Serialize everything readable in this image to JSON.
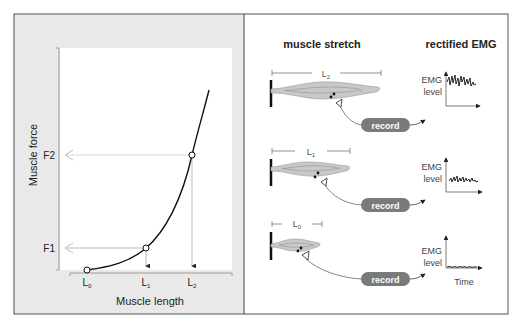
{
  "left_panel": {
    "y_axis_label": "Muscle force",
    "x_axis_label": "Muscle length",
    "y_ticks": [
      {
        "label": "F2",
        "y": 155
      },
      {
        "label": "F1",
        "y": 248
      }
    ],
    "x_ticks": [
      {
        "label": "L",
        "sub": "0",
        "x": 87
      },
      {
        "label": "L",
        "sub": "1",
        "x": 146
      },
      {
        "label": "L",
        "sub": "2",
        "x": 192
      }
    ],
    "points": [
      {
        "name": "L0",
        "x": 87,
        "y": 270
      },
      {
        "name": "L1",
        "x": 146,
        "y": 248
      },
      {
        "name": "L2",
        "x": 192,
        "y": 155
      }
    ]
  },
  "right_panel": {
    "col_title_stretch": "muscle stretch",
    "col_title_emg": "rectified EMG",
    "rows": [
      {
        "length_label": "L",
        "length_sub": "2",
        "record_label": "record",
        "emg_label_1": "EMG",
        "emg_label_2": "level",
        "emg_amplitude": "high"
      },
      {
        "length_label": "L",
        "length_sub": "1",
        "record_label": "record",
        "emg_label_1": "EMG",
        "emg_label_2": "level",
        "emg_amplitude": "medium"
      },
      {
        "length_label": "L",
        "length_sub": "0",
        "record_label": "record",
        "emg_label_1": "EMG",
        "emg_label_2": "level",
        "emg_amplitude": "low"
      }
    ],
    "time_label": "Time"
  },
  "colors": {
    "left_bg": "#e9e9e9",
    "plot_bg": "#ffffff",
    "border": "#555555",
    "muscle_fill": "#c8c8c8",
    "record_button": "#7a7a7a",
    "guide_line": "#aaaaaa"
  }
}
